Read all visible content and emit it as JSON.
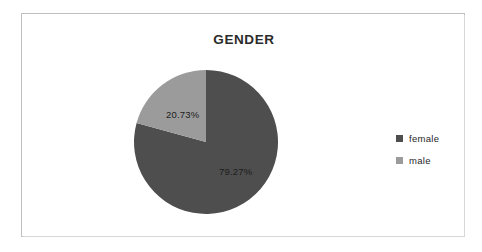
{
  "chart_data": {
    "type": "pie",
    "title": "GENDER",
    "categories": [
      "female",
      "male"
    ],
    "values": [
      79.27,
      20.73
    ],
    "value_unit": "%",
    "data_labels": [
      "79.27%",
      "20.73%"
    ],
    "colors": [
      "#4e4e4e",
      "#9b9b9b"
    ],
    "legend_position": "right",
    "start_angle_deg": 0,
    "direction": "clockwise",
    "grid": false,
    "xlabel": "",
    "ylabel": ""
  },
  "chart": {
    "title": "GENDER",
    "slices": [
      {
        "name": "female",
        "label": "79.27%",
        "value": 79.27,
        "color": "#4e4e4e"
      },
      {
        "name": "male",
        "label": "20.73%",
        "value": 20.73,
        "color": "#9b9b9b"
      }
    ],
    "legend": [
      {
        "label": "female",
        "color": "#4e4e4e"
      },
      {
        "label": "male",
        "color": "#9b9b9b"
      }
    ]
  }
}
